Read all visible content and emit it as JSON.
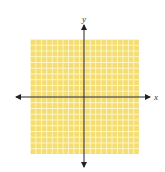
{
  "figure": {
    "type": "coordinate-plane",
    "x_axis_label": "x",
    "y_axis_label": "y",
    "grid": {
      "columns": 20,
      "rows": 20,
      "fill_color": "#f4dd72",
      "line_color": "#fffad7"
    },
    "axis_color": "#222222"
  }
}
